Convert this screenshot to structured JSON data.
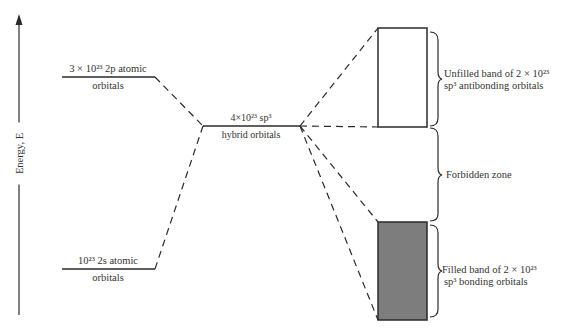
{
  "diagram": {
    "title": "",
    "axis": {
      "label": "Energy, E"
    },
    "levels": {
      "p2": {
        "line1": "3 × 10²³ 2p atomic",
        "line2": "orbitals"
      },
      "s2": {
        "line1": "10²³ 2s atomic",
        "line2": "orbitals"
      },
      "hybrid": {
        "line1": "4×10²³    sp³",
        "line2": "hybrid orbitals"
      }
    },
    "bands": {
      "antibonding": {
        "line1": "Unfilled band of 2 × 10²³",
        "line2": "sp³ antibonding orbitals",
        "fill": "#ffffff"
      },
      "forbidden": {
        "label": "Forbidden zone"
      },
      "bonding": {
        "line1": "Filled band of 2 × 10²³",
        "line2": "sp³ bonding orbitals",
        "fill": "#7d7d7d"
      }
    },
    "colors": {
      "line": "#2a2a2a",
      "filled_band": "#7d7d7d"
    }
  }
}
